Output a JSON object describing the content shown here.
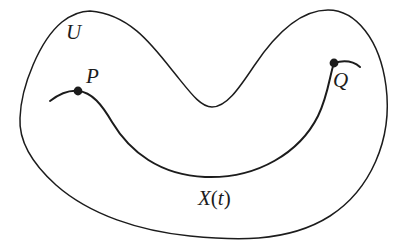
{
  "figure": {
    "type": "mathematical-diagram",
    "background_color": "#ffffff",
    "stroke_color": "#1c1c1c",
    "labels": {
      "region": "U",
      "start_point": "P",
      "end_point": "Q",
      "curve_open": "X",
      "curve_paren_open": "(",
      "curve_param": "t",
      "curve_paren_close": ")"
    },
    "points": [
      {
        "name": "P",
        "x": 78,
        "y": 91
      },
      {
        "name": "Q",
        "x": 334,
        "y": 63
      }
    ],
    "geometry": {
      "region_boundary_path": "M 90,11 C 128,14 150,42 172,70 C 190,92 200,107 212,107 C 226,107 238,90 254,66 C 276,33 300,10 328,10 C 356,10 380,40 386,86 C 393,140 370,190 330,216 C 286,244 230,240 190,236 C 140,231 90,215 56,185 C 26,158 19,135 20,118 C 21,86 40,40 62,22 C 71,15 80,11 90,11 Z",
      "curve_path": "M 50,101 C 58,95 68,90 78,91 C 92,92 102,105 112,122 C 130,152 160,175 205,177 C 258,179 300,152 318,116 C 328,96 330,74 334,63",
      "q_tail_path": "M 334,63 C 344,60 353,61 360,67"
    }
  }
}
